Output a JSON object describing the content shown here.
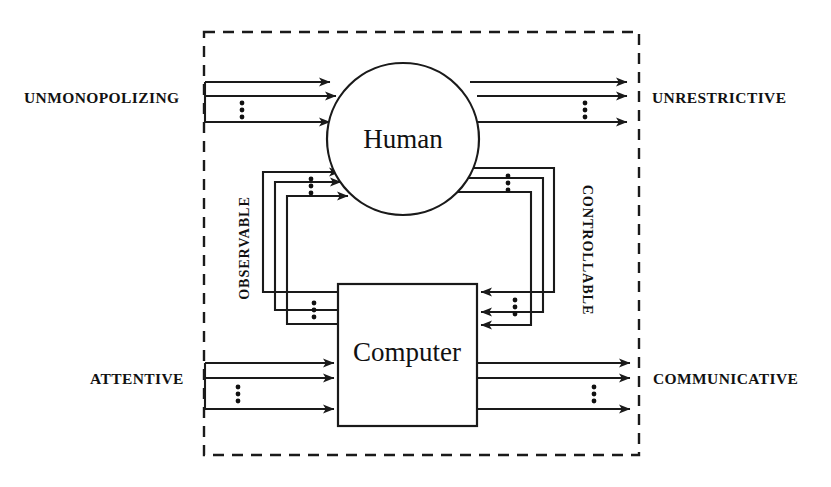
{
  "diagram": {
    "type": "block-diagram",
    "nodes": [
      {
        "id": "human",
        "label": "Human",
        "shape": "circle"
      },
      {
        "id": "computer",
        "label": "Computer",
        "shape": "rectangle"
      }
    ],
    "labels": {
      "top_left": "UNMONOPOLIZING",
      "top_right": "UNRESTRICTIVE",
      "bottom_left": "ATTENTIVE",
      "bottom_right": "COMMUNICATIVE",
      "inner_left": "OBSERVABLE",
      "inner_right": "CONTROLLABLE"
    },
    "colors": {
      "stroke": "#1a1a1a",
      "fill": "#ffffff",
      "text": "#111111"
    },
    "boundary": {
      "style": "dashed",
      "meaning": "system boundary"
    },
    "channel_counts": {
      "top_left_arrows": 3,
      "top_right_arrows": 3,
      "bottom_left_arrows": 3,
      "bottom_right_arrows": 3,
      "observable_loop_lines": 3,
      "controllable_loop_lines": 3
    }
  }
}
